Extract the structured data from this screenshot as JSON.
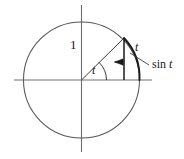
{
  "figure": {
    "kind": "unit-circle-sine-diagram",
    "background_color": "#ffffff",
    "stroke_color": "#3c3c3c",
    "axis_color": "#6e6e6e",
    "emphasis_color": "#1a1a1a",
    "labels": {
      "radius": "1",
      "angle": "t",
      "arc": "t",
      "sine_fn": "sin",
      "sine_var": "t"
    }
  },
  "geometry": {
    "center_x": 81.5,
    "center_y": 80,
    "radius": 58,
    "angle_degrees": 46,
    "point_on_circle_x": 124,
    "point_on_circle_y": 38,
    "x_axis_start": 14,
    "x_axis_end": 152,
    "y_axis_start": 5,
    "y_axis_end": 152,
    "angle_arc_radius": 25,
    "sine_arrow_y": 62
  }
}
